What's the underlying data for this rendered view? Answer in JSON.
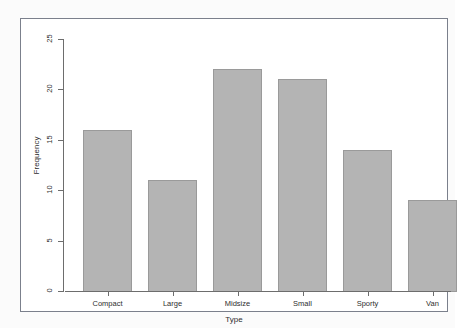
{
  "chart_data": {
    "type": "bar",
    "title": "",
    "subtitle": "",
    "xlabel": "Type",
    "ylabel": "Frequency",
    "categories": [
      "Compact",
      "Large",
      "Midsize",
      "Small",
      "Sporty",
      "Van"
    ],
    "values": [
      16,
      11,
      22,
      21,
      14,
      9
    ],
    "ylim": [
      0,
      25
    ],
    "ytick_labels": [
      "0",
      "5",
      "10",
      "15",
      "20",
      "25"
    ],
    "ytick_values": [
      0,
      5,
      10,
      15,
      20,
      25
    ],
    "grid": false,
    "legend": null,
    "legend_position": "none",
    "annotations": [],
    "style": {
      "bar_fill": "#b4b4b4",
      "bar_border": "#9a9a9a",
      "axis_color": "#6d6d6d",
      "frame_color": "#7b808c",
      "text_color": "#2e2e2e",
      "plot_background": "#ffffff",
      "page_background": "#fbfbfb"
    },
    "bars": [
      {
        "label": "Compact",
        "value": 16
      },
      {
        "label": "Large",
        "value": 11
      },
      {
        "label": "Midsize",
        "value": 22
      },
      {
        "label": "Small",
        "value": 21
      },
      {
        "label": "Sporty",
        "value": 14
      },
      {
        "label": "Van",
        "value": 9
      }
    ]
  }
}
